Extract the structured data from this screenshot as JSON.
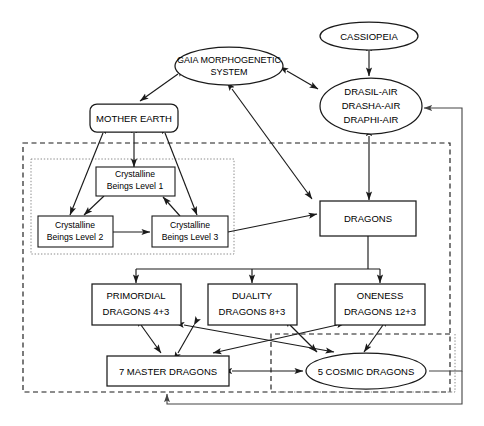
{
  "diagram": {
    "canvas": {
      "width": 484,
      "height": 426
    },
    "nodes": [
      {
        "id": "cassiopeia",
        "label": "CASSIOPEIA",
        "shape": "ellipse",
        "lines": [
          "CASSIOPEIA"
        ]
      },
      {
        "id": "gaia",
        "label": "GAIA MORPHOGENETIC SYSTEM",
        "shape": "ellipse",
        "lines": [
          "GAIA MORPHOGENETIC",
          "SYSTEM"
        ]
      },
      {
        "id": "drasil",
        "label": "DRASIL-AIR DRASHA-AIR DRAPHI-AIR",
        "shape": "ellipse",
        "lines": [
          "DRASIL-AIR",
          "DRASHA-AIR",
          "DRAPHI-AIR"
        ]
      },
      {
        "id": "mother",
        "label": "MOTHER EARTH",
        "shape": "rounded-rect",
        "lines": [
          "MOTHER EARTH"
        ]
      },
      {
        "id": "cb1",
        "label": "Crystalline Beings Level 1",
        "shape": "rect",
        "lines": [
          "Crystalline",
          "Beings Level 1"
        ]
      },
      {
        "id": "cb2",
        "label": "Crystalline Beings Level 2",
        "shape": "rect",
        "lines": [
          "Crystalline",
          "Beings Level 2"
        ]
      },
      {
        "id": "cb3",
        "label": "Crystalline Beings Level 3",
        "shape": "rect",
        "lines": [
          "Crystalline",
          "Beings Level 3"
        ]
      },
      {
        "id": "dragons",
        "label": "DRAGONS",
        "shape": "rect",
        "lines": [
          "DRAGONS"
        ]
      },
      {
        "id": "primordial",
        "label": "PRIMORDIAL DRAGONS 4+3",
        "shape": "rect",
        "lines": [
          "PRIMORDIAL",
          "DRAGONS 4+3"
        ]
      },
      {
        "id": "duality",
        "label": "DUALITY DRAGONS 8+3",
        "shape": "rect",
        "lines": [
          "DUALITY",
          "DRAGONS 8+3"
        ]
      },
      {
        "id": "oneness",
        "label": "ONENESS DRAGONS 12+3",
        "shape": "rect",
        "lines": [
          "ONENESS",
          "DRAGONS 12+3"
        ]
      },
      {
        "id": "master",
        "label": "7 MASTER DRAGONS",
        "shape": "rect",
        "lines": [
          "7 MASTER DRAGONS"
        ]
      },
      {
        "id": "cosmic",
        "label": "5 COSMIC DRAGONS",
        "shape": "ellipse",
        "lines": [
          "5 COSMIC DRAGONS"
        ]
      }
    ],
    "groups": [
      {
        "id": "outer-group",
        "style": "dashed",
        "note": "large dashed boundary enclosing crystalline beings and all dragon tiers"
      },
      {
        "id": "crystalline-group",
        "style": "dotted",
        "note": "dotted boundary around the three crystalline beings levels"
      },
      {
        "id": "cosmic-group",
        "style": "dashed",
        "note": "dashed boundary around 5 cosmic dragons region"
      }
    ],
    "edges": [
      {
        "from": "cassiopeia",
        "to": "drasil",
        "arrow": "both"
      },
      {
        "from": "gaia",
        "to": "drasil",
        "arrow": "both"
      },
      {
        "from": "gaia",
        "to": "mother",
        "arrow": "both"
      },
      {
        "from": "gaia",
        "to": "dragons",
        "arrow": "both"
      },
      {
        "from": "drasil",
        "to": "dragons",
        "arrow": "both"
      },
      {
        "from": "mother",
        "to": "cb1",
        "arrow": "both"
      },
      {
        "from": "mother",
        "to": "cb2",
        "arrow": "both"
      },
      {
        "from": "mother",
        "to": "cb3",
        "arrow": "both"
      },
      {
        "from": "cb1",
        "to": "cb2",
        "arrow": "single"
      },
      {
        "from": "cb1",
        "to": "cb3",
        "arrow": "single"
      },
      {
        "from": "cb2",
        "to": "cb3",
        "arrow": "single"
      },
      {
        "from": "cb3",
        "to": "dragons",
        "arrow": "single"
      },
      {
        "from": "dragons",
        "to": "primordial",
        "arrow": "single"
      },
      {
        "from": "dragons",
        "to": "duality",
        "arrow": "single"
      },
      {
        "from": "dragons",
        "to": "oneness",
        "arrow": "single"
      },
      {
        "from": "primordial",
        "to": "master",
        "arrow": "both"
      },
      {
        "from": "duality",
        "to": "master",
        "arrow": "both"
      },
      {
        "from": "oneness",
        "to": "master",
        "arrow": "both"
      },
      {
        "from": "primordial",
        "to": "cosmic",
        "arrow": "both"
      },
      {
        "from": "duality",
        "to": "cosmic",
        "arrow": "both"
      },
      {
        "from": "oneness",
        "to": "cosmic",
        "arrow": "both"
      },
      {
        "from": "master",
        "to": "cosmic",
        "arrow": "both"
      },
      {
        "from": "cosmic",
        "to": "drasil",
        "arrow": "single",
        "route": "right-loop"
      },
      {
        "from": "cosmic",
        "to": "master",
        "arrow": "single",
        "route": "bottom-loop"
      }
    ],
    "colors": {
      "stroke": "#1a1a1a",
      "fill": "#ffffff",
      "group_dashed": "#1a1a1a",
      "group_dotted": "#8a8a8a",
      "text": "#000000"
    }
  }
}
